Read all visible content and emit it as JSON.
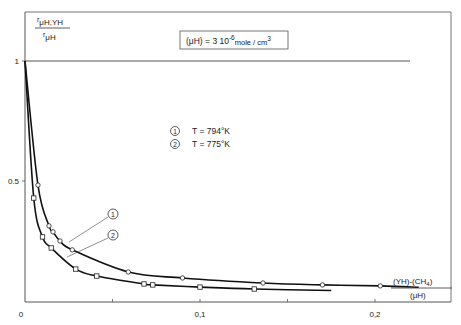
{
  "chart_data": {
    "type": "line",
    "title": "",
    "ylabel": {
      "numerator": "r",
      "numerator_sub": "μH,YH",
      "denominator": "r",
      "denominator_sub": "μH"
    },
    "xlabel": {
      "numerator": "(YH)-(CH",
      "numerator_sub": "4",
      "numerator_end": ")",
      "denominator": "(μH)"
    },
    "condition_box": {
      "prefix": "(μH) = 3 10",
      "exponent": "-6",
      "unit": "mole / cm",
      "unit_exp": "3"
    },
    "xlim": [
      0,
      0.24
    ],
    "ylim": [
      0,
      1.2
    ],
    "x_ticks": [
      {
        "value": 0,
        "label": "0"
      },
      {
        "value": 0.05,
        "label": ""
      },
      {
        "value": 0.1,
        "label": "0,1"
      },
      {
        "value": 0.15,
        "label": ""
      },
      {
        "value": 0.2,
        "label": "0,2"
      }
    ],
    "y_ticks": [
      {
        "value": 0.5,
        "label": "0.5"
      },
      {
        "value": 1,
        "label": "1"
      }
    ],
    "reference_line": {
      "y": 1
    },
    "legend": [
      {
        "marker": "1",
        "label": "T = 794°K"
      },
      {
        "marker": "2",
        "label": "T = 775°K"
      }
    ],
    "series": [
      {
        "name": "T = 794°K",
        "id": "1",
        "marker": "circle",
        "x": [
          0.0074,
          0.0137,
          0.016,
          0.02,
          0.027,
          0.059,
          0.09,
          0.136,
          0.17,
          0.203
        ],
        "y": [
          0.483,
          0.313,
          0.288,
          0.25,
          0.213,
          0.121,
          0.096,
          0.075,
          0.067,
          0.063
        ]
      },
      {
        "name": "T = 775°K",
        "id": "2",
        "marker": "square",
        "x": [
          0.005,
          0.01,
          0.015,
          0.029,
          0.041,
          0.068,
          0.073,
          0.1,
          0.131
        ],
        "y": [
          0.429,
          0.267,
          0.221,
          0.133,
          0.104,
          0.071,
          0.067,
          0.058,
          0.05
        ]
      }
    ],
    "annotations": [
      {
        "label": "1",
        "points_to_series": "T = 794°K"
      },
      {
        "label": "2",
        "points_to_series": "T = 775°K"
      }
    ]
  }
}
